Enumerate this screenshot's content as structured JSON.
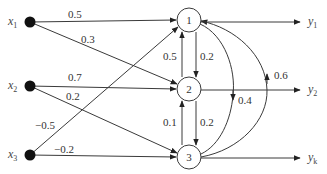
{
  "diagram": {
    "title": "",
    "inputs": [
      {
        "id": "x1",
        "label": "x",
        "sub": "1"
      },
      {
        "id": "x2",
        "label": "x",
        "sub": "2"
      },
      {
        "id": "x3",
        "label": "x",
        "sub": "3"
      }
    ],
    "neurons": [
      {
        "id": "n1",
        "label": "1"
      },
      {
        "id": "n2",
        "label": "2"
      },
      {
        "id": "n3",
        "label": "3"
      }
    ],
    "outputs": [
      {
        "id": "y1",
        "label": "y",
        "sub": "1",
        "from": "n1"
      },
      {
        "id": "y2",
        "label": "y",
        "sub": "2",
        "from": "n2"
      },
      {
        "id": "yk",
        "label": "y",
        "sub": "k",
        "from": "n3"
      }
    ],
    "edges": [
      {
        "from": "x1",
        "to": "n1",
        "weight": "0.5"
      },
      {
        "from": "x1",
        "to": "n2",
        "weight": "0.3"
      },
      {
        "from": "x2",
        "to": "n2",
        "weight": "0.7"
      },
      {
        "from": "x2",
        "to": "n3",
        "weight": "0.2"
      },
      {
        "from": "x3",
        "to": "n1",
        "weight": "−0.5"
      },
      {
        "from": "x3",
        "to": "n3",
        "weight": "−0.2"
      },
      {
        "from": "n2",
        "to": "n1",
        "weight": "0.5"
      },
      {
        "from": "n1",
        "to": "n2",
        "weight": "0.2"
      },
      {
        "from": "n3",
        "to": "n2",
        "weight": "0.1"
      },
      {
        "from": "n2",
        "to": "n3",
        "weight": "0.2"
      },
      {
        "from": "n1",
        "to": "n3",
        "weight": "0.4"
      },
      {
        "from": "n3",
        "to": "n1",
        "weight": "0.6"
      }
    ]
  }
}
